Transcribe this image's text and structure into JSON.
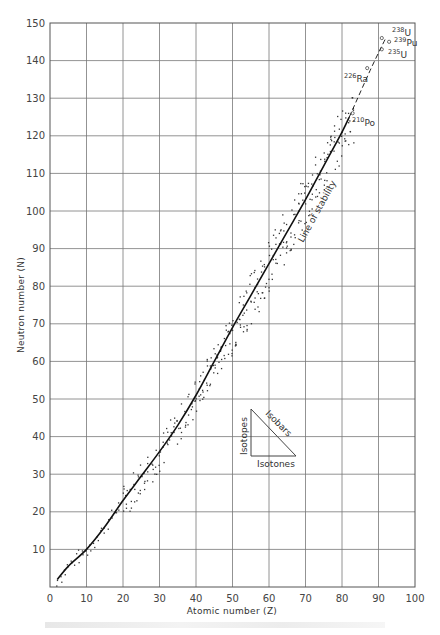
{
  "chart_data": {
    "type": "line",
    "title": "",
    "xlabel": "Atomic number (Z)",
    "ylabel": "Neutron number (N)",
    "xlim": [
      0,
      100
    ],
    "ylim": [
      0,
      150
    ],
    "grid": true,
    "x_ticks": [
      0,
      10,
      20,
      30,
      40,
      50,
      60,
      70,
      80,
      90,
      100
    ],
    "y_ticks": [
      10,
      20,
      30,
      40,
      50,
      60,
      70,
      80,
      90,
      100,
      110,
      120,
      130,
      140,
      150
    ],
    "series": [
      {
        "name": "Line of stability",
        "style": "solid",
        "points": [
          [
            2,
            2
          ],
          [
            5,
            5.5
          ],
          [
            10,
            10
          ],
          [
            15,
            16
          ],
          [
            20,
            23
          ],
          [
            25,
            29.5
          ],
          [
            30,
            36
          ],
          [
            35,
            43
          ],
          [
            40,
            51
          ],
          [
            45,
            60
          ],
          [
            50,
            69
          ],
          [
            55,
            77.5
          ],
          [
            60,
            86
          ],
          [
            65,
            94.5
          ],
          [
            70,
            103
          ],
          [
            75,
            112
          ],
          [
            80,
            121
          ],
          [
            82,
            125
          ]
        ]
      },
      {
        "name": "Line of stability (extrapolated)",
        "style": "dashed",
        "points": [
          [
            82,
            125
          ],
          [
            88,
            138
          ],
          [
            92,
            146
          ]
        ]
      }
    ],
    "stable_nuclides_scatter": "dense dots scattered along the line of stability from Z≈2 to Z≈83",
    "annotations": [
      {
        "label": "238U",
        "mass": "238",
        "symbol": "U",
        "z": 92,
        "n": 146
      },
      {
        "label": "239Pu",
        "mass": "239",
        "symbol": "Pu",
        "z": 94,
        "n": 145
      },
      {
        "label": "235U",
        "mass": "235",
        "symbol": "U",
        "z": 92,
        "n": 143
      },
      {
        "label": "226Ra",
        "mass": "226",
        "symbol": "Ra",
        "z": 88,
        "n": 138
      },
      {
        "label": "210Po",
        "mass": "210",
        "symbol": "Po",
        "z": 84,
        "n": 126
      }
    ],
    "curve_label": "Line of stability",
    "legend_triangle": {
      "vertical_edge": "Isotopes",
      "hypotenuse": "Isobars",
      "horizontal_edge": "Isotones"
    }
  },
  "labels": {
    "xlabel": "Atomic number (Z)",
    "ylabel": "Neutron number (N)",
    "curve": "Line of stability",
    "isotopes": "Isotopes",
    "isobars": "Isobars",
    "isotones": "Isotones",
    "u238_mass": "238",
    "u238_sym": "U",
    "pu239_mass": "239",
    "pu239_sym": "Pu",
    "u235_mass": "235",
    "u235_sym": "U",
    "ra226_mass": "226",
    "ra226_sym": "Ra",
    "po210_mass": "210",
    "po210_sym": "Po"
  }
}
